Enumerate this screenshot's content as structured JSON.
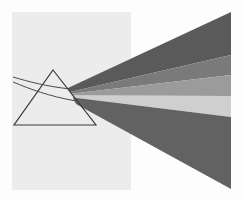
{
  "figure": {
    "background_color": "#fdfdfd",
    "panel": {
      "x": 12,
      "y": 12,
      "width": 119,
      "height": 178,
      "color": "#ececec"
    },
    "prism": {
      "apex": [
        53,
        70
      ],
      "base_left": [
        14,
        125
      ],
      "base_right": [
        96,
        125
      ],
      "stroke": "#3a3a3a",
      "fill": "#fbfbfb"
    },
    "incoming_rays": [
      {
        "path": "M13,77 C30,82 45,86 70,89",
        "stroke": "#4a4a4a"
      },
      {
        "path": "M13,82 C30,89 48,96 76,101",
        "stroke": "#4a4a4a"
      }
    ],
    "spectrum": {
      "origin_top": [
        68,
        88
      ],
      "origin_bottom": [
        76,
        104
      ],
      "right_edge_x": 231,
      "bands": [
        {
          "name": "band-1",
          "color": "#5a5a5a",
          "top": 12,
          "bottom": 55
        },
        {
          "name": "band-2",
          "color": "#7a7a7a",
          "top": 55,
          "bottom": 75
        },
        {
          "name": "band-3",
          "color": "#9b9b9b",
          "top": 75,
          "bottom": 96
        },
        {
          "name": "band-4",
          "color": "#cfcfcf",
          "top": 96,
          "bottom": 117
        },
        {
          "name": "band-5",
          "color": "#626262",
          "top": 117,
          "bottom": 189
        }
      ]
    }
  }
}
